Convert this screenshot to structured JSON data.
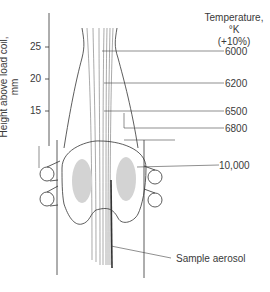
{
  "diagram": {
    "y_axis": {
      "label": "Height above load coil, mm",
      "ticks": [
        "25",
        "20",
        "15"
      ]
    },
    "temperature_legend": {
      "title_line1": "Temperature, °K",
      "title_line2": "(+10%)"
    },
    "temperature_labels": [
      "6000",
      "6200",
      "6500",
      "6800",
      "10,000"
    ],
    "callouts": {
      "sample": "Sample aerosol"
    },
    "colors": {
      "line": "#333333",
      "hot_zone": "#d0d0d0",
      "text": "#3a3a3a"
    }
  }
}
